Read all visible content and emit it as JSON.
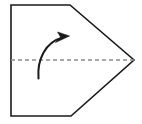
{
  "figure": {
    "title": "Origami fold diagram step",
    "background_color": "#ffffff",
    "width": 142,
    "height": 124,
    "shape": {
      "name": "pentagon-paper-outline",
      "description": "Pentagon shaped paper with pointed right vertex",
      "stroke_color": "#1a1a1a",
      "fill_color": "#ffffff",
      "stroke_width": 1.6,
      "points": "11,5 70,5 134,60 71,116 11,116"
    },
    "fold_line": {
      "name": "horizontal-dashed-fold-line",
      "description": "Dashed horizontal center fold line",
      "stroke_color": "#8c8c8c",
      "stroke_width": 1.4,
      "dash_pattern": "4,3",
      "x1": 11,
      "y1": 60,
      "x2": 134,
      "y2": 60
    },
    "arrow": {
      "name": "fold-up-curved-arrow",
      "description": "Curved arrow indicating fold direction upward to the right",
      "stroke_color": "#1a1a1a",
      "fill_color": "#1a1a1a",
      "stroke_width": 2.0,
      "path": "M 38.5,78.5 C 37.0,60.0 45.0,42.0 63.0,37.5",
      "head_points": "69.5,36.0 57.5,32.0 60.5,37.0 55.5,42.5"
    }
  }
}
